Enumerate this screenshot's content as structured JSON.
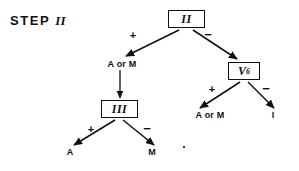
{
  "diagram": {
    "title_word": "STEP",
    "title_numeral": "II",
    "background_color": "#ffffff",
    "ink_color": "#101010",
    "type": "decision-tree",
    "nodes": [
      {
        "id": "root",
        "label": "II",
        "kind": "boxed-roman",
        "x": 186,
        "y": 19
      },
      {
        "id": "v6",
        "label": "V",
        "subscript": "6",
        "kind": "boxed-variable",
        "x": 244,
        "y": 71
      },
      {
        "id": "three",
        "label": "III",
        "kind": "boxed-roman",
        "x": 119,
        "y": 109
      },
      {
        "id": "aorm1",
        "label": "A or M",
        "kind": "text",
        "x": 122,
        "y": 65
      },
      {
        "id": "aorm2",
        "label": "A or M",
        "kind": "text",
        "x": 210,
        "y": 116
      },
      {
        "id": "i",
        "label": "I",
        "kind": "text",
        "x": 272,
        "y": 116
      },
      {
        "id": "a",
        "label": "A",
        "kind": "text",
        "x": 70,
        "y": 153
      },
      {
        "id": "m",
        "label": "M",
        "kind": "text",
        "x": 152,
        "y": 153
      }
    ],
    "edges": [
      {
        "from": "root",
        "to": "aorm1",
        "sign": "+",
        "sign_x": 133,
        "sign_y": 36
      },
      {
        "from": "root",
        "to": "v6",
        "sign": "−",
        "sign_x": 208,
        "sign_y": 35
      },
      {
        "from": "aorm1",
        "to": "three",
        "sign": "",
        "sign_x": 0,
        "sign_y": 0
      },
      {
        "from": "v6",
        "to": "aorm2",
        "sign": "+",
        "sign_x": 212,
        "sign_y": 90
      },
      {
        "from": "v6",
        "to": "i",
        "sign": "−",
        "sign_x": 266,
        "sign_y": 89
      },
      {
        "from": "three",
        "to": "a",
        "sign": "+",
        "sign_x": 91,
        "sign_y": 130
      },
      {
        "from": "three",
        "to": "m",
        "sign": "−",
        "sign_x": 147,
        "sign_y": 129
      }
    ]
  }
}
